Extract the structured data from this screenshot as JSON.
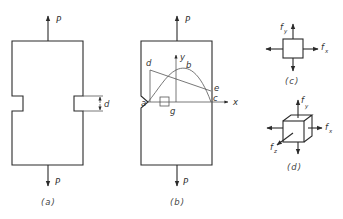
{
  "figure_a": {
    "caption": "(a)",
    "load_top": "P",
    "load_bottom": "P",
    "notch_dimension": "d"
  },
  "figure_b": {
    "caption": "(b)",
    "load_top": "P",
    "load_bottom": "P",
    "axis_x": "x",
    "axis_y": "y",
    "points": {
      "a": "a",
      "b": "b",
      "c": "c",
      "d": "d",
      "e": "e",
      "g": "g"
    }
  },
  "figure_c": {
    "caption": "(c)",
    "stress_x": "f",
    "stress_x_sub": "x",
    "stress_y": "f",
    "stress_y_sub": "y"
  },
  "figure_d": {
    "caption": "(d)",
    "stress_x": "f",
    "stress_x_sub": "x",
    "stress_y": "f",
    "stress_y_sub": "y",
    "stress_z": "f",
    "stress_z_sub": "z"
  },
  "colors": {
    "line": "#2a2a2a",
    "background": "#ffffff"
  }
}
